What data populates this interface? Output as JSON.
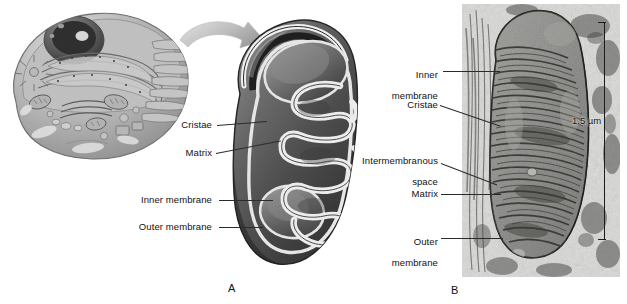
{
  "figure": {
    "panels": [
      {
        "letter": "A",
        "kind": "illustration"
      },
      {
        "letter": "B",
        "kind": "electron-micrograph"
      }
    ]
  },
  "panel_a": {
    "letter": "A",
    "cell_diagram": {
      "name": "eukaryotic-cell-cutaway"
    },
    "arrow": {
      "name": "magnify-arrow"
    },
    "mitochondrion": {
      "name": "mitochondrion-cutaway"
    },
    "labels": [
      {
        "text": "Cristae",
        "name": "label-cristae"
      },
      {
        "text": "Matrix",
        "name": "label-matrix"
      },
      {
        "text": "Inner membrane",
        "name": "label-inner-membrane"
      },
      {
        "text": "Outer membrane",
        "name": "label-outer-membrane"
      }
    ]
  },
  "panel_b": {
    "letter": "B",
    "micrograph": {
      "name": "mitochondrion-micrograph"
    },
    "labels": [
      {
        "line1": "Inner",
        "line2": "membrane",
        "name": "label-inner-membrane"
      },
      {
        "line1": "Cristae",
        "line2": "",
        "name": "label-cristae"
      },
      {
        "line1": "Intermembranous",
        "line2": "space",
        "name": "label-intermembranous-space"
      },
      {
        "line1": "Matrix",
        "line2": "",
        "name": "label-matrix"
      },
      {
        "line1": "Outer",
        "line2": "membrane",
        "name": "label-outer-membrane"
      }
    ],
    "scale_bar": {
      "text": "1.5 µm"
    }
  },
  "colors": {
    "ink": "#111111",
    "leader": "#2b2b2b",
    "membrane_dark": "#4a4a4a",
    "membrane_light": "#e8e8e8",
    "micrograph_bg": "#d8d8d6"
  }
}
